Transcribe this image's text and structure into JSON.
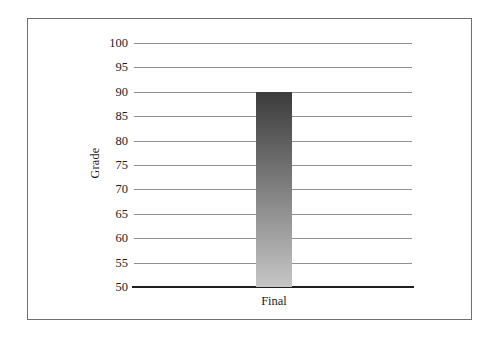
{
  "chart_data": {
    "type": "bar",
    "title": "",
    "xlabel": "",
    "ylabel": "Grade",
    "categories": [
      "Final"
    ],
    "values": [
      90
    ],
    "ylim": [
      50,
      100
    ],
    "ytick_interval": 5,
    "yticks": [
      100,
      95,
      90,
      85,
      80,
      75,
      70,
      65,
      60,
      55,
      50
    ],
    "grid": true,
    "legend": false,
    "colors": {
      "bar_gradient_top": "#3b3b3b",
      "bar_gradient_bottom": "#c6c6c6",
      "gridline": "#8f8f8f",
      "baseline": "#1f1f1f",
      "frame_border": "#6f6f6f",
      "text": "#1c1c1c"
    }
  }
}
